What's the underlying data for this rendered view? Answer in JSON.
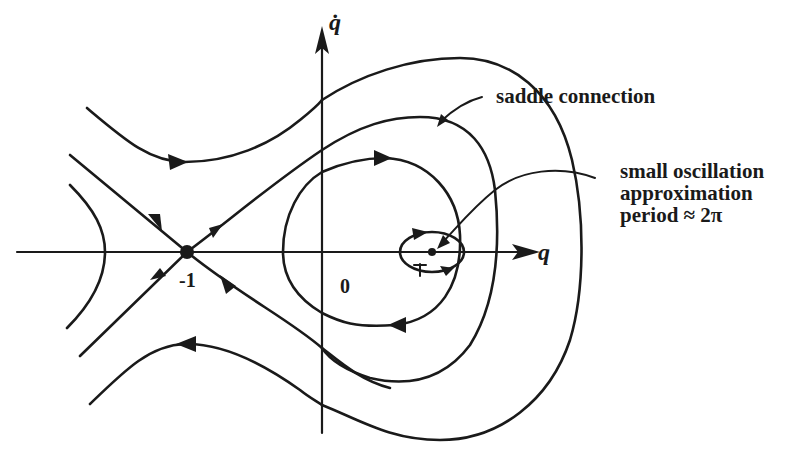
{
  "figure": {
    "axes": {
      "x_label": "q",
      "y_label": "q̇"
    },
    "points": {
      "saddle": {
        "q": -1,
        "label": "-1"
      },
      "origin": {
        "label": "0"
      },
      "center": {
        "q": 1,
        "label": "1"
      }
    },
    "annotations": {
      "saddle_connection": "saddle connection",
      "small_oscillation": [
        "small oscillation",
        "approximation",
        "period ≈ 2π"
      ]
    },
    "colors": {
      "ink": "#1a1a1a",
      "background": "#ffffff"
    }
  }
}
